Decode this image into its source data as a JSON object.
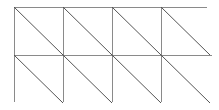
{
  "figure": {
    "background_color": "#ffffff",
    "line_color": "#8a8a8a",
    "diagonal_color": "#555555"
  },
  "chart_data": {
    "type": "diagram",
    "columns": 4,
    "rows": 2,
    "cell_width": 49,
    "cell_height": 48,
    "origin_x": 14,
    "origin_y": 7,
    "diagonal_direction": "top-left-to-bottom-right",
    "vertical_x": [
      14,
      63,
      112,
      161
    ],
    "horizontal_y": [
      7,
      55
    ],
    "right_edge_x": 207,
    "bottom_edge_y": 102,
    "has_right_border": false,
    "has_bottom_border": false,
    "grid": true,
    "legend": false,
    "verticals": [
      {
        "x": 14,
        "y1": 7,
        "y2": 102
      },
      {
        "x": 63,
        "y1": 7,
        "y2": 102
      },
      {
        "x": 112,
        "y1": 7,
        "y2": 102
      },
      {
        "x": 161,
        "y1": 7,
        "y2": 102
      }
    ],
    "horizontals": [
      {
        "y": 7,
        "x1": 14,
        "x2": 207
      },
      {
        "y": 55,
        "x1": 14,
        "x2": 212
      }
    ],
    "diagonals": [
      {
        "x1": 14,
        "y1": 7,
        "x2": 63,
        "y2": 55
      },
      {
        "x1": 63,
        "y1": 7,
        "x2": 112,
        "y2": 55
      },
      {
        "x1": 112,
        "y1": 7,
        "x2": 161,
        "y2": 55
      },
      {
        "x1": 161,
        "y1": 7,
        "x2": 210,
        "y2": 55
      },
      {
        "x1": 14,
        "y1": 55,
        "x2": 63,
        "y2": 103
      },
      {
        "x1": 63,
        "y1": 55,
        "x2": 112,
        "y2": 103
      },
      {
        "x1": 112,
        "y1": 55,
        "x2": 161,
        "y2": 103
      },
      {
        "x1": 161,
        "y1": 55,
        "x2": 210,
        "y2": 103
      }
    ]
  }
}
